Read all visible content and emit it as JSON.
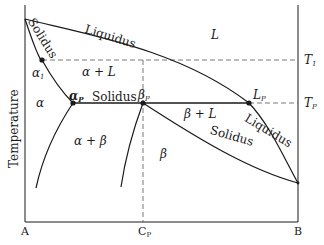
{
  "diagram": {
    "axis": {
      "ylabel": "Temperature",
      "x_ticks": {
        "left": "A",
        "middle": "C",
        "middle_sub": "P",
        "right": "B"
      },
      "right_ticks": [
        {
          "label": "T",
          "sub": "1"
        },
        {
          "label": "T",
          "sub": "P"
        }
      ]
    },
    "curves": {
      "liquidus_upper": "Liquidus",
      "solidus_left": "Solidus",
      "peritectic_line": "Solidus",
      "liquidus_lower": "Liquidus",
      "solidus_lower": "Solidus"
    },
    "points": [
      {
        "label": "α",
        "sub": "1"
      },
      {
        "label": "α",
        "sub": "P"
      },
      {
        "label": "β",
        "sub": "P"
      },
      {
        "label": "L",
        "sub": "P"
      }
    ],
    "regions": {
      "liquid": "L",
      "alpha_plus_liquid": "α + L",
      "alpha": "α",
      "alpha_plus_beta": "α + β",
      "beta": "β",
      "beta_plus_liquid": "β + L"
    },
    "colors": {
      "line": "#1a1a1a",
      "dashed": "#555555"
    }
  }
}
